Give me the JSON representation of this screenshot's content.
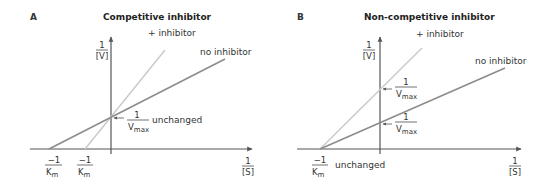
{
  "panels": [
    {
      "letter": "A",
      "title": "Competitive inhibitor",
      "y_axis_label": {
        "num": "1",
        "den": "[V]"
      },
      "x_axis_label": {
        "num": "1",
        "den": "[S]"
      },
      "lines": [
        {
          "name": "no inhibitor",
          "label": "no inhibitor"
        },
        {
          "name": "+ inhibitor",
          "label": "+ inhibitor"
        }
      ],
      "y_intercept_label": {
        "num": "1",
        "den": "V",
        "den_sub": "max",
        "note": "unchanged"
      },
      "x_intercept_labels": [
        {
          "num": "−1",
          "den": "K",
          "den_sub": "m"
        },
        {
          "num": "−1",
          "den": "K",
          "den_sub": "m"
        }
      ]
    },
    {
      "letter": "B",
      "title": "Non-competitive inhibitor",
      "y_axis_label": {
        "num": "1",
        "den": "[V]"
      },
      "x_axis_label": {
        "num": "1",
        "den": "[S]"
      },
      "lines": [
        {
          "name": "no inhibitor",
          "label": "no inhibitor"
        },
        {
          "name": "+ inhibitor",
          "label": "+ inhibitor"
        }
      ],
      "y_intercept_labels": [
        {
          "num": "1",
          "den": "V",
          "den_sub": "max"
        },
        {
          "num": "1",
          "den": "V",
          "den_sub": "max"
        }
      ],
      "x_intercept_label": {
        "num": "−1",
        "den": "K",
        "den_sub": "m",
        "note": "unchanged"
      }
    }
  ],
  "colors": {
    "axis": "#555555",
    "no_inhibitor_line": "#8c8c8c",
    "inhibitor_line": "#c9c9c9"
  }
}
